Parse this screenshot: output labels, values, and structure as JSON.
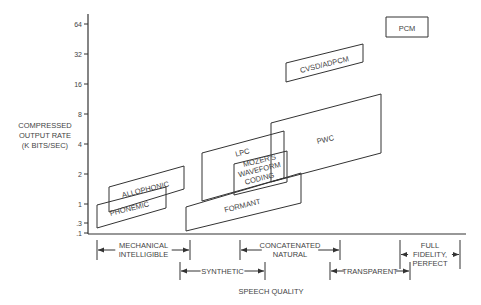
{
  "chart_data": {
    "type": "diagram",
    "title": "",
    "ylabel": [
      "COMPRESSED",
      "OUTPUT RATE",
      "(K BITS/SEC)"
    ],
    "xlabel": "SPEECH QUALITY",
    "y_ticks": [
      {
        "label": "64",
        "y": 24
      },
      {
        "label": "32",
        "y": 54
      },
      {
        "label": "16",
        "y": 84
      },
      {
        "label": "8",
        "y": 114
      },
      {
        "label": "4",
        "y": 144
      },
      {
        "label": "2",
        "y": 174
      },
      {
        "label": "1",
        "y": 204
      },
      {
        "label": ".3",
        "y": 223
      },
      {
        "label": ".1",
        "y": 233
      }
    ],
    "regions": [
      {
        "name": "PCM",
        "points": "386,17 428,17 428,37 386,37",
        "label_x": 407,
        "label_y": 31,
        "angle": 0
      },
      {
        "name": "CVSD/ADPCM",
        "points": "286,63 363,44 363,62 286,82",
        "label_x": 325,
        "label_y": 67,
        "angle": -14
      },
      {
        "name": "PWC",
        "points": "271,123 381,94 381,153 271,182",
        "label_x": 326,
        "label_y": 142,
        "angle": -14
      },
      {
        "name": "LPC",
        "points": "202,153 284,131 284,178 202,201",
        "label_x": 243,
        "label_y": 155,
        "angle": -14
      },
      {
        "name": "MOZER'S WAVEFORM CODING",
        "lines": [
          "MOZER'S",
          "WAVEFORM",
          "CODING"
        ],
        "points": "234,164 287,151 287,182 234,195",
        "label_x": 260,
        "label_y": 172,
        "angle": -14
      },
      {
        "name": "FORMANT",
        "points": "186,207 301,173 301,203 186,231",
        "label_x": 243,
        "label_y": 208,
        "angle": -14
      },
      {
        "name": "ALLOPHONIC",
        "points": "109,187 184,166 184,189 109,212",
        "label_x": 146,
        "label_y": 192,
        "angle": -14
      },
      {
        "name": "PHONEMIC",
        "points": "97,205 166,187 166,208 97,228",
        "label_x": 130,
        "label_y": 211,
        "angle": -14
      }
    ],
    "quality_ranges": [
      {
        "lines": [
          "MECHANICAL",
          "INTELLIGIBLE"
        ],
        "x1": 97,
        "x2": 190,
        "row": 0
      },
      {
        "lines": [
          "SYNTHETIC"
        ],
        "x1": 180,
        "x2": 265,
        "row": 1
      },
      {
        "lines": [
          "CONCATENATED",
          "NATURAL"
        ],
        "x1": 240,
        "x2": 340,
        "row": 0
      },
      {
        "lines": [
          "TRANSPARENT"
        ],
        "x1": 330,
        "x2": 410,
        "row": 1
      },
      {
        "lines": [
          "FULL",
          "FIDELITY,",
          "PERFECT"
        ],
        "x1": 400,
        "x2": 460,
        "row": 0
      }
    ],
    "axis": {
      "x_origin": 88,
      "y_origin": 234,
      "x_end": 466,
      "y_top": 14
    }
  }
}
